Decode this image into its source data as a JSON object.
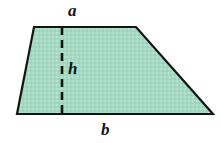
{
  "figure": {
    "kind": "geometry-diagram",
    "shape_name": "trapezoid",
    "background_color": "#ffffff",
    "fill_color": "#a5d9c3",
    "fill_texture_color": "#bfe4d2",
    "stroke_color": "#141414",
    "stroke_width": 2.2,
    "dash_stroke_color": "#141414",
    "dash_width": 2.6,
    "dash_pattern": "8 5",
    "vertices": {
      "top_left": [
        34,
        27
      ],
      "top_right": [
        136,
        27
      ],
      "bottom_right": [
        213,
        114
      ],
      "bottom_left": [
        17,
        114
      ]
    },
    "height_line": {
      "x": 62,
      "y_top": 27,
      "y_bottom": 114
    }
  },
  "labels": {
    "top_base": "a",
    "bottom_base": "b",
    "height": "h"
  }
}
